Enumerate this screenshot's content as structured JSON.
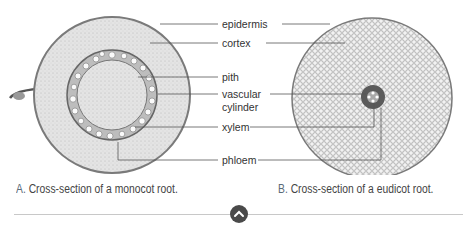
{
  "figure": {
    "labels": [
      {
        "text": "epidermis"
      },
      {
        "text": "cortex"
      },
      {
        "text": "pith"
      },
      {
        "text": "vascular"
      },
      {
        "text": "cylinder"
      },
      {
        "text": "xylem"
      },
      {
        "text": "phloem"
      }
    ],
    "colors": {
      "line": "#555555",
      "tissue_dark": "#6b6b6b",
      "tissue_light": "#e6e6e6"
    }
  },
  "captions": {
    "a_letter": "A.",
    "a_text": "Cross-section of a monocot root.",
    "b_letter": "B.",
    "b_text": "Cross-section of a eudicot root."
  },
  "nav": {
    "scroll_up_icon": "chevron-up-icon"
  }
}
